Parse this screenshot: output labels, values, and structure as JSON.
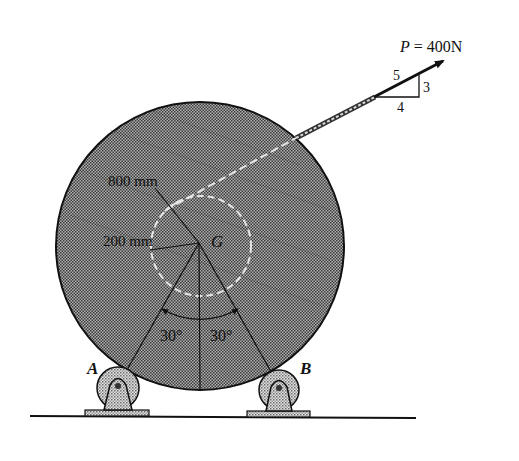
{
  "figure": {
    "type": "statics-problem-diagram"
  },
  "force": {
    "label": "P = 400N",
    "symbol": "P",
    "magnitude": "400N",
    "slope": {
      "hypotenuse": "5",
      "rise": "3",
      "run": "4"
    }
  },
  "dimensions": {
    "outer_radius": "800 mm",
    "inner_radius": "200 mm",
    "angle_left": "30°",
    "angle_right": "30°"
  },
  "points": {
    "center": "G",
    "roller_left": "A",
    "roller_right": "B"
  },
  "colors": {
    "ink": "#111111",
    "drum_fill": "#8c8c8c",
    "roller_fill": "#bdbdbd",
    "cable_highlight": "#e6e6e6",
    "background": "#ffffff"
  }
}
